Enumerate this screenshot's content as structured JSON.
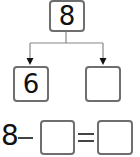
{
  "diagram": {
    "type": "number-bond",
    "whole": "8",
    "parts": [
      "6",
      ""
    ],
    "equation": {
      "minuend": "8",
      "operator": "−",
      "blank_1": "",
      "equals": "=",
      "blank_2": ""
    }
  },
  "colors": {
    "box_border": "#6e6e6e",
    "line": "#888888",
    "text": "#111111"
  }
}
